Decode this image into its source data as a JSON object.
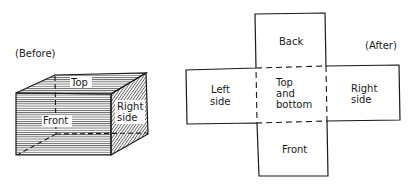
{
  "before": {
    "caption": "(Before)",
    "faces": {
      "top": "Top",
      "front": "Front",
      "right_line1": "Right",
      "right_line2": "side"
    }
  },
  "after": {
    "caption": "(After)",
    "panels": {
      "back": "Back",
      "left_line1": "Left",
      "left_line2": "side",
      "center_line1": "Top",
      "center_line2": "and",
      "center_line3": "bottom",
      "right_line1": "Right",
      "right_line2": "side",
      "front": "Front"
    }
  },
  "colors": {
    "ink": "#1a1a1a",
    "paper": "#ffffff"
  }
}
